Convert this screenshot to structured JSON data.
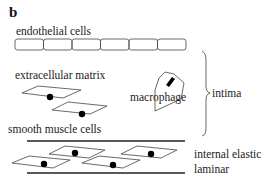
{
  "panel_label": "b",
  "labels": {
    "endothelial": "endothelial cells",
    "matrix": "extracellular matrix",
    "smooth_muscle": "smooth muscle cells",
    "macrophage": "macrophage",
    "intima": "intima",
    "iel_line1": "internal elastic",
    "iel_line2": "laminar"
  },
  "endothelial_cell_count": 6,
  "colors": {
    "stroke": "#444444",
    "nucleus": "#000000",
    "text": "#222222"
  }
}
